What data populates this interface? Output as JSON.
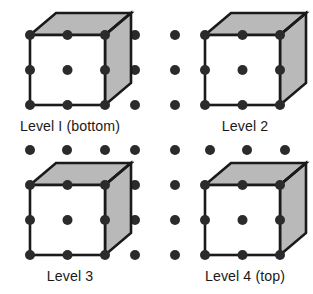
{
  "figure": {
    "title": "",
    "type": "crystal-lattice-levels",
    "width": 313,
    "height": 294,
    "background_color": "#ffffff",
    "dot_color": "#2b2b2b",
    "edge_color": "#1a1a1a",
    "top_face_color": "#b9b9b9",
    "right_face_color": "#b9b9b9",
    "front_face_color": "#ffffff",
    "label_color": "#1a1a1a"
  },
  "panels": [
    {
      "id": "level-1",
      "label": "Level I (bottom)",
      "label_x": 70,
      "label_y": 131,
      "origin_x": 30,
      "origin_y": 35
    },
    {
      "id": "level-2",
      "label": "Level 2",
      "label_x": 245,
      "label_y": 131,
      "origin_x": 205,
      "origin_y": 35
    },
    {
      "id": "level-3",
      "label": "Level 3",
      "label_x": 70,
      "label_y": 281,
      "origin_x": 30,
      "origin_y": 185
    },
    {
      "id": "level-4",
      "label": "Level 4 (top)",
      "label_x": 245,
      "label_y": 281,
      "origin_x": 205,
      "origin_y": 185
    }
  ],
  "cube_geometry": {
    "front_width": 75,
    "front_height": 70,
    "depth_dx": 26,
    "depth_dy": -22,
    "dot_radius": 5.0,
    "edge_width": 2.6,
    "front_dot_grid": "3x3"
  },
  "background_dots": {
    "note": "isolated lattice points surrounding the cubes",
    "radius": 5.0,
    "columns_x": [
      135,
      175,
      30,
      67.5,
      105,
      210,
      247.5,
      285
    ],
    "rows_y": [
      35,
      70,
      105,
      150,
      185,
      220,
      255
    ]
  },
  "dot_positions": [
    {
      "x": 135,
      "y": 35
    },
    {
      "x": 175,
      "y": 35
    },
    {
      "x": 135,
      "y": 70
    },
    {
      "x": 175,
      "y": 70
    },
    {
      "x": 135,
      "y": 105
    },
    {
      "x": 175,
      "y": 105
    },
    {
      "x": 30,
      "y": 150
    },
    {
      "x": 67,
      "y": 150
    },
    {
      "x": 105,
      "y": 150
    },
    {
      "x": 135,
      "y": 150
    },
    {
      "x": 175,
      "y": 150
    },
    {
      "x": 210,
      "y": 150
    },
    {
      "x": 247,
      "y": 150
    },
    {
      "x": 285,
      "y": 150
    },
    {
      "x": 135,
      "y": 185
    },
    {
      "x": 175,
      "y": 185
    },
    {
      "x": 135,
      "y": 220
    },
    {
      "x": 175,
      "y": 220
    },
    {
      "x": 135,
      "y": 255
    },
    {
      "x": 175,
      "y": 255
    }
  ]
}
